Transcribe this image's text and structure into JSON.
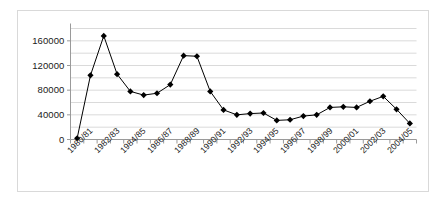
{
  "chart_data": {
    "type": "line",
    "title": "",
    "xlabel": "",
    "ylabel": "",
    "ylim": [
      0,
      180000
    ],
    "yticks": [
      0,
      40000,
      80000,
      120000,
      160000
    ],
    "ytick_labels": [
      "0",
      "40000",
      "80000",
      "120000",
      "160000"
    ],
    "gridlines": [
      20000,
      40000,
      60000,
      80000,
      100000,
      120000,
      140000,
      160000,
      180000
    ],
    "grid": true,
    "legend": "none",
    "marker": "diamond",
    "marker_color": "#000000",
    "line_color": "#000000",
    "categories": [
      "1980/81",
      "1981/82",
      "1982/83",
      "1983/84",
      "1984/85",
      "1985/86",
      "1986/87",
      "1987/88",
      "1988/89",
      "1989/90",
      "1990/91",
      "1991/92",
      "1992/93",
      "1993/94",
      "1994/95",
      "1995/96",
      "1996/97",
      "1997/98",
      "1998/99",
      "1999/00",
      "2000/01",
      "2001/02",
      "2002/03",
      "2003/04",
      "2004/05",
      "2005/06"
    ],
    "xtick_labels": [
      "1980/81",
      "1982/83",
      "1984/85",
      "1986/87",
      "1988/89",
      "1990/91",
      "1992/93",
      "1994/95",
      "1996/97",
      "1998/99",
      "2000/01",
      "2002/03",
      "2004/05"
    ],
    "xtick_label_indices": [
      0,
      2,
      4,
      6,
      8,
      10,
      12,
      14,
      16,
      18,
      20,
      22,
      24
    ],
    "values": [
      2000,
      104000,
      168000,
      106000,
      78000,
      72000,
      75000,
      89000,
      136000,
      135000,
      78000,
      48000,
      40000,
      42000,
      43000,
      31000,
      32000,
      38000,
      40000,
      52000,
      53000,
      52000,
      62000,
      70000,
      49000,
      26000
    ]
  }
}
